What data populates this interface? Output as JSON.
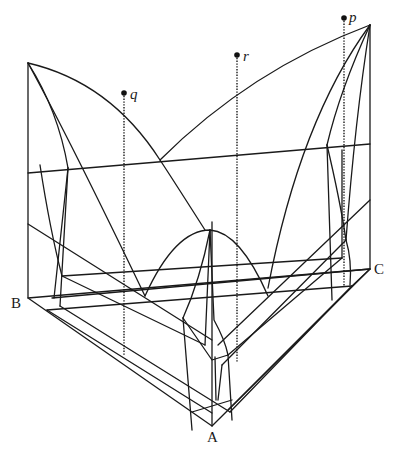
{
  "diagram": {
    "vertices": [
      {
        "label": "A",
        "x": 213,
        "y": 440
      },
      {
        "label": "B",
        "x": 22,
        "y": 303
      },
      {
        "label": "C",
        "x": 375,
        "y": 268
      }
    ],
    "composition_points": [
      {
        "label": "q",
        "x": 124,
        "y": 93
      },
      {
        "label": "r",
        "x": 237,
        "y": 55
      },
      {
        "label": "p",
        "x": 344,
        "y": 18
      }
    ],
    "colors": {
      "line": "#1a1a1a",
      "background": "#ffffff"
    }
  }
}
